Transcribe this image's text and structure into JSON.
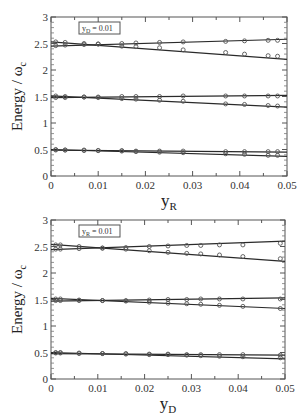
{
  "chart_data": [
    {
      "type": "line",
      "title": "",
      "xlabel": "y_R",
      "xlabel_main": "y",
      "xlabel_sub": "R",
      "ylabel": "Energy / ω_c",
      "ylabel_main": "Energy / ω",
      "ylabel_sub": "c",
      "xlim": [
        0,
        0.05
      ],
      "ylim": [
        0,
        3
      ],
      "xticks": [
        "0",
        "0.01",
        "0.02",
        "0.03",
        "0.04",
        "0.05"
      ],
      "yticks": [
        "0",
        "0.5",
        "1",
        "1.5",
        "2",
        "2.5",
        "3"
      ],
      "annotation": {
        "main": "y",
        "sub": "D",
        "rest": " = 0.01"
      },
      "grid": false,
      "series": [
        {
          "name": "level 2.5 upper (line)",
          "x": [
            0,
            0.05
          ],
          "y": [
            2.45,
            2.58
          ]
        },
        {
          "name": "level 2.5 lower (line)",
          "x": [
            0,
            0.05
          ],
          "y": [
            2.53,
            2.2
          ]
        },
        {
          "name": "level 1.5 upper (line)",
          "x": [
            0,
            0.05
          ],
          "y": [
            1.48,
            1.52
          ]
        },
        {
          "name": "level 1.5 lower (line)",
          "x": [
            0,
            0.05
          ],
          "y": [
            1.51,
            1.3
          ]
        },
        {
          "name": "level 0.5 upper (line)",
          "x": [
            0,
            0.05
          ],
          "y": [
            0.49,
            0.45
          ]
        },
        {
          "name": "level 0.5 lower (line)",
          "x": [
            0,
            0.05
          ],
          "y": [
            0.5,
            0.37
          ]
        }
      ],
      "points": [
        {
          "x": [
            0.001,
            0.003,
            0.007,
            0.01,
            0.015,
            0.018,
            0.023,
            0.028,
            0.037,
            0.041,
            0.046,
            0.048
          ],
          "y_pairs": [
            [
              2.46,
              2.53
            ],
            [
              2.47,
              2.52
            ],
            [
              2.48,
              2.5
            ],
            [
              2.49,
              2.49
            ],
            [
              2.5,
              2.45
            ],
            [
              2.51,
              2.44
            ],
            [
              2.52,
              2.42
            ],
            [
              2.53,
              2.38
            ],
            [
              2.54,
              2.33
            ],
            [
              2.55,
              2.3
            ],
            [
              2.56,
              2.27
            ],
            [
              2.56,
              2.26
            ]
          ],
          "level": 2.5
        },
        {
          "x": [
            0.001,
            0.003,
            0.007,
            0.01,
            0.015,
            0.018,
            0.023,
            0.028,
            0.037,
            0.041,
            0.046,
            0.048
          ],
          "y_pairs": [
            [
              1.48,
              1.51
            ],
            [
              1.48,
              1.5
            ],
            [
              1.49,
              1.49
            ],
            [
              1.49,
              1.48
            ],
            [
              1.5,
              1.46
            ],
            [
              1.5,
              1.45
            ],
            [
              1.5,
              1.43
            ],
            [
              1.51,
              1.41
            ],
            [
              1.51,
              1.36
            ],
            [
              1.51,
              1.35
            ],
            [
              1.51,
              1.33
            ],
            [
              1.51,
              1.32
            ]
          ],
          "level": 1.5
        },
        {
          "x": [
            0.001,
            0.003,
            0.007,
            0.01,
            0.015,
            0.018,
            0.023,
            0.028,
            0.037,
            0.041,
            0.046,
            0.048
          ],
          "y_pairs": [
            [
              0.49,
              0.5
            ],
            [
              0.49,
              0.49
            ],
            [
              0.49,
              0.48
            ],
            [
              0.48,
              0.48
            ],
            [
              0.48,
              0.47
            ],
            [
              0.47,
              0.46
            ],
            [
              0.47,
              0.45
            ],
            [
              0.47,
              0.44
            ],
            [
              0.46,
              0.42
            ],
            [
              0.46,
              0.41
            ],
            [
              0.46,
              0.39
            ],
            [
              0.46,
              0.39
            ]
          ],
          "level": 0.5
        }
      ]
    },
    {
      "type": "line",
      "title": "",
      "xlabel": "y_D",
      "xlabel_main": "y",
      "xlabel_sub": "D",
      "ylabel": "Energy / ω_c",
      "ylabel_main": "Energy / ω",
      "ylabel_sub": "c",
      "xlim": [
        0,
        0.05
      ],
      "ylim": [
        0,
        3
      ],
      "xticks": [
        "0",
        "0.01",
        "0.02",
        "0.03",
        "0.04",
        "0.05"
      ],
      "yticks": [
        "0",
        "0.5",
        "1",
        "1.5",
        "2",
        "2.5",
        "3"
      ],
      "annotation": {
        "main": "y",
        "sub": "R",
        "rest": " = 0.01"
      },
      "grid": false,
      "series": [
        {
          "name": "level 2.5 upper (line)",
          "x": [
            0,
            0.05
          ],
          "y": [
            2.44,
            2.6
          ]
        },
        {
          "name": "level 2.5 lower (line)",
          "x": [
            0,
            0.05
          ],
          "y": [
            2.54,
            2.22
          ]
        },
        {
          "name": "level 1.5 upper (line)",
          "x": [
            0,
            0.05
          ],
          "y": [
            1.47,
            1.53
          ]
        },
        {
          "name": "level 1.5 lower (line)",
          "x": [
            0,
            0.05
          ],
          "y": [
            1.52,
            1.33
          ]
        },
        {
          "name": "level 0.5 upper (line)",
          "x": [
            0,
            0.05
          ],
          "y": [
            0.48,
            0.45
          ]
        },
        {
          "name": "level 0.5 lower (line)",
          "x": [
            0,
            0.05
          ],
          "y": [
            0.5,
            0.38
          ]
        }
      ],
      "points": [
        {
          "x": [
            0.001,
            0.002,
            0.006,
            0.011,
            0.016,
            0.021,
            0.025,
            0.029,
            0.032,
            0.036,
            0.041,
            0.049
          ],
          "y_pairs": [
            [
              2.45,
              2.53
            ],
            [
              2.45,
              2.53
            ],
            [
              2.46,
              2.5
            ],
            [
              2.47,
              2.47
            ],
            [
              2.48,
              2.45
            ],
            [
              2.5,
              2.42
            ],
            [
              2.51,
              2.39
            ],
            [
              2.52,
              2.37
            ],
            [
              2.52,
              2.36
            ],
            [
              2.53,
              2.34
            ],
            [
              2.53,
              2.31
            ],
            [
              2.56,
              2.27
            ]
          ],
          "level": 2.5
        },
        {
          "x": [
            0.001,
            0.002,
            0.006,
            0.011,
            0.016,
            0.021,
            0.025,
            0.029,
            0.032,
            0.036,
            0.041,
            0.049
          ],
          "y_pairs": [
            [
              1.48,
              1.51
            ],
            [
              1.48,
              1.51
            ],
            [
              1.48,
              1.49
            ],
            [
              1.48,
              1.48
            ],
            [
              1.48,
              1.47
            ],
            [
              1.49,
              1.45
            ],
            [
              1.5,
              1.43
            ],
            [
              1.5,
              1.42
            ],
            [
              1.51,
              1.41
            ],
            [
              1.51,
              1.39
            ],
            [
              1.51,
              1.37
            ],
            [
              1.51,
              1.33
            ]
          ],
          "level": 1.5
        },
        {
          "x": [
            0.001,
            0.002,
            0.006,
            0.011,
            0.016,
            0.021,
            0.025,
            0.029,
            0.032,
            0.036,
            0.041,
            0.049
          ],
          "y_pairs": [
            [
              0.49,
              0.5
            ],
            [
              0.49,
              0.5
            ],
            [
              0.48,
              0.49
            ],
            [
              0.48,
              0.48
            ],
            [
              0.48,
              0.47
            ],
            [
              0.47,
              0.46
            ],
            [
              0.47,
              0.46
            ],
            [
              0.46,
              0.45
            ],
            [
              0.46,
              0.44
            ],
            [
              0.46,
              0.43
            ],
            [
              0.46,
              0.42
            ],
            [
              0.45,
              0.4
            ]
          ],
          "level": 0.5
        }
      ]
    }
  ],
  "layout": {
    "panels": [
      {
        "x0": 51,
        "x1": 287,
        "y0": 176,
        "y1": 17
      },
      {
        "x0": 51,
        "x1": 285,
        "y0": 379,
        "y1": 220
      }
    ],
    "line_color": "#2a2a2a",
    "marker_color": "#555555"
  }
}
